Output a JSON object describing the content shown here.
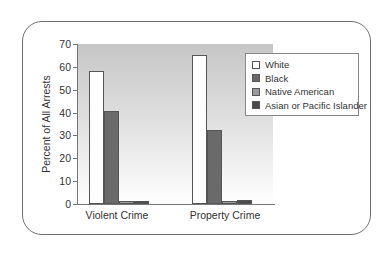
{
  "chart_data": {
    "type": "bar",
    "title": "",
    "xlabel": "",
    "ylabel": "Percent of All Arrests",
    "ylim": [
      0,
      70
    ],
    "yticks": [
      0,
      10,
      20,
      30,
      40,
      50,
      60,
      70
    ],
    "categories": [
      "Violent Crime",
      "Property Crime"
    ],
    "series": [
      {
        "name": "White",
        "color": "#ffffff",
        "values": [
          58,
          65
        ]
      },
      {
        "name": "Black",
        "color": "#6a6a6a",
        "values": [
          40.5,
          32.5
        ]
      },
      {
        "name": "Native American",
        "color": "#9a9a9a",
        "values": [
          1.3,
          1.2
        ]
      },
      {
        "name": "Asian or Pacific Islander",
        "color": "#4a4a4a",
        "values": [
          1.4,
          1.9
        ]
      }
    ],
    "legend_position": "upper right",
    "grid": false
  },
  "labels": {
    "ylabel": "Percent of All Arrests",
    "ticks": [
      "0",
      "10",
      "20",
      "30",
      "40",
      "50",
      "60",
      "70"
    ],
    "categories": [
      "Violent Crime",
      "Property Crime"
    ],
    "legend": [
      "White",
      "Black",
      "Native American",
      "Asian or Pacific Islander"
    ]
  }
}
